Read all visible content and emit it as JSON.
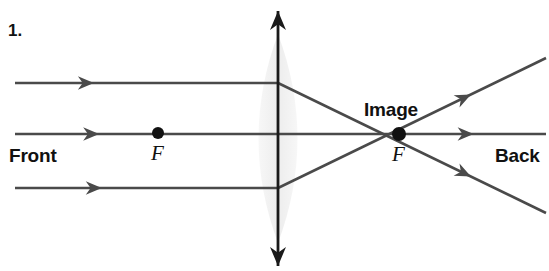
{
  "figure": {
    "number_label": "1.",
    "title_implicit": "Converging lens ray diagram",
    "width": 549,
    "height": 271,
    "background_color": "#ffffff"
  },
  "labels": {
    "front": "Front",
    "back": "Back",
    "image": "Image",
    "focal_front": "F",
    "focal_back": "F"
  },
  "colors": {
    "ray": "#4a4a4a",
    "axis": "#1a1a1a",
    "lens_fill": "#ededed",
    "lens_fill_edge": "#f7f7f7",
    "text": "#111111",
    "dot": "#111111"
  },
  "geometry": {
    "lens": {
      "center_x": 278,
      "top_y": 34,
      "bottom_y": 243,
      "half_width": 19
    },
    "principal_axis": {
      "x": 278,
      "top_tip_y": 11,
      "bottom_tip_y": 266
    },
    "optical_axis_y": 134,
    "focal_front": {
      "x": 158,
      "y": 133,
      "dot_radius": 6
    },
    "focal_back": {
      "x": 399,
      "y": 134,
      "dot_radius": 7
    },
    "rays_in": [
      {
        "name": "upper-incoming-ray",
        "x1": 15,
        "y1": 83,
        "x2": 278,
        "y2": 83,
        "arrow_t": 0.3
      },
      {
        "name": "axial-incoming-ray",
        "x1": 15,
        "y1": 134,
        "x2": 278,
        "y2": 134,
        "arrow_t": 0.32
      },
      {
        "name": "lower-incoming-ray",
        "x1": 15,
        "y1": 188,
        "x2": 278,
        "y2": 188,
        "arrow_t": 0.33
      }
    ],
    "rays_out": [
      {
        "name": "upper-refracted-ray",
        "x1": 278,
        "y1": 83,
        "x2": 546,
        "y2": 213,
        "arrow_t": 0.72
      },
      {
        "name": "axial-ray-continued",
        "x1": 278,
        "y1": 134,
        "x2": 546,
        "y2": 134,
        "arrow_t": 0.73
      },
      {
        "name": "lower-refracted-ray",
        "x1": 278,
        "y1": 188,
        "x2": 546,
        "y2": 58,
        "arrow_t": 0.72
      }
    ]
  },
  "text_positions": {
    "number": {
      "x": 8,
      "y": 22
    },
    "front": {
      "x": 9,
      "y": 146
    },
    "back": {
      "x": 495,
      "y": 146
    },
    "image": {
      "x": 364,
      "y": 100
    },
    "focal_front": {
      "x": 151,
      "y": 143
    },
    "focal_back": {
      "x": 392,
      "y": 144
    }
  }
}
